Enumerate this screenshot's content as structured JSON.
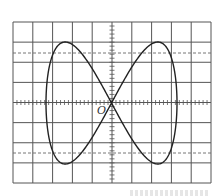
{
  "figure": {
    "type": "oscilloscope-lissajous",
    "origin_label": "O",
    "grid": {
      "left": 13,
      "top": 22,
      "right": 211,
      "bottom": 183,
      "columns": 10,
      "rows": 8,
      "dashed_lines_y": [
        53,
        153
      ],
      "minor_ticks_per_division": 5,
      "line_color": "#555555",
      "dashed_color": "#666666"
    },
    "curve": {
      "equation": "x = A·sin(t), y = B·sin(2t)",
      "center": [
        111.5,
        103
      ],
      "amplitude_x": 65.5,
      "amplitude_y": 61,
      "color": "#222222",
      "stroke_width": 1.4
    }
  },
  "chart_data": {
    "type": "line",
    "title": "",
    "xlabel": "",
    "ylabel": "",
    "x_extent_divisions": [
      -3.3,
      3.3
    ],
    "y_extent_divisions": [
      -3.05,
      3.05
    ],
    "peaks": [
      {
        "x_div": -1.8,
        "y_div": 3.05
      },
      {
        "x_div": 1.8,
        "y_div": 3.05
      }
    ],
    "troughs": [
      {
        "x_div": -1.8,
        "y_div": -3.05
      },
      {
        "x_div": 1.8,
        "y_div": -3.05
      }
    ],
    "crossing_point": {
      "x_div": 0,
      "y_div": 0,
      "label": "O"
    },
    "grid": true
  }
}
